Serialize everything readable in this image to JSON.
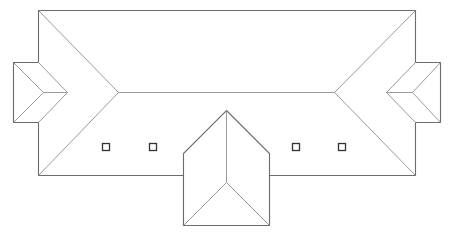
{
  "diagram": {
    "type": "roof-plan",
    "colors": {
      "background": "#ffffff",
      "line": "#8a8a8a",
      "eave": "#6c6c6c",
      "skylight": "#333333"
    },
    "main_roof": {
      "label": "hip roof",
      "outline": [
        [
          38,
          10
        ],
        [
          415,
          10
        ],
        [
          415,
          62
        ],
        [
          440,
          62
        ],
        [
          440,
          122
        ],
        [
          415,
          122
        ],
        [
          415,
          175
        ],
        [
          269,
          175
        ],
        [
          269,
          225
        ],
        [
          183,
          225
        ],
        [
          183,
          175
        ],
        [
          38,
          175
        ],
        [
          38,
          122
        ],
        [
          13,
          122
        ],
        [
          13,
          62
        ],
        [
          38,
          62
        ]
      ],
      "ridge": [
        [
          118,
          92
        ],
        [
          334,
          92
        ]
      ],
      "hips": [
        [
          [
            38,
            10
          ],
          [
            118,
            92
          ]
        ],
        [
          [
            415,
            10
          ],
          [
            334,
            92
          ]
        ],
        [
          [
            38,
            175
          ],
          [
            118,
            92
          ]
        ],
        [
          [
            415,
            175
          ],
          [
            334,
            92
          ]
        ]
      ]
    },
    "left_wing": {
      "label": "left dormer",
      "box": [
        [
          13,
          62
        ],
        [
          38,
          62
        ],
        [
          38,
          122
        ],
        [
          13,
          122
        ]
      ],
      "apex": [
        67,
        92
      ],
      "inner": [
        43,
        92
      ],
      "lines": [
        [
          [
            13,
            62
          ],
          [
            43,
            92
          ]
        ],
        [
          [
            13,
            122
          ],
          [
            43,
            92
          ]
        ],
        [
          [
            43,
            92
          ],
          [
            67,
            92
          ]
        ],
        [
          [
            38,
            62
          ],
          [
            67,
            92
          ]
        ],
        [
          [
            38,
            122
          ],
          [
            67,
            92
          ]
        ]
      ]
    },
    "right_wing": {
      "label": "right dormer",
      "box": [
        [
          415,
          62
        ],
        [
          440,
          62
        ],
        [
          440,
          122
        ],
        [
          415,
          122
        ]
      ],
      "apex": [
        386,
        92
      ],
      "inner": [
        412,
        92
      ],
      "lines": [
        [
          [
            440,
            62
          ],
          [
            412,
            92
          ]
        ],
        [
          [
            440,
            122
          ],
          [
            412,
            92
          ]
        ],
        [
          [
            412,
            92
          ],
          [
            386,
            92
          ]
        ],
        [
          [
            415,
            62
          ],
          [
            386,
            92
          ]
        ],
        [
          [
            415,
            122
          ],
          [
            386,
            92
          ]
        ]
      ]
    },
    "center_gable": {
      "label": "front gable",
      "outline": [
        [
          226,
          110
        ],
        [
          269,
          153
        ],
        [
          269,
          225
        ],
        [
          183,
          225
        ],
        [
          183,
          153
        ]
      ],
      "inner": [
        226,
        182
      ],
      "lines": [
        [
          [
            226,
            110
          ],
          [
            226,
            182
          ]
        ],
        [
          [
            226,
            182
          ],
          [
            183,
            225
          ]
        ],
        [
          [
            226,
            182
          ],
          [
            269,
            225
          ]
        ]
      ]
    },
    "skylights": [
      {
        "x": 102,
        "y": 143,
        "size": 7
      },
      {
        "x": 149,
        "y": 143,
        "size": 7
      },
      {
        "x": 292,
        "y": 143,
        "size": 7
      },
      {
        "x": 338,
        "y": 143,
        "size": 7
      }
    ]
  }
}
